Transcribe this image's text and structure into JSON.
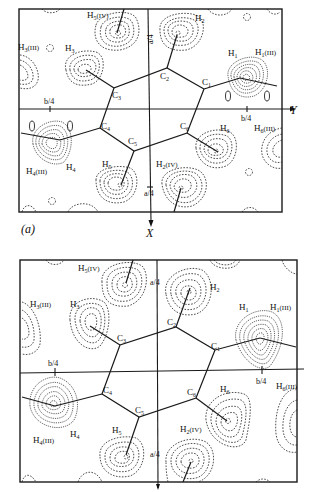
{
  "figure": {
    "panel_a": {
      "label": "(a)",
      "x_axis_label": "X",
      "y_axis_label": "Y",
      "tick_b4_left": "b/4",
      "tick_b4_right": "b/4",
      "tick_a4_top": "a/4",
      "tick_a4_bottom": "a/4",
      "carbons": [
        "C1",
        "C2",
        "C3",
        "C4",
        "C5",
        "C6"
      ],
      "hydrogens": [
        "H1",
        "H1(III)",
        "H2",
        "H2(IV)",
        "H3",
        "H3(III)",
        "H4",
        "H4(III)",
        "H5",
        "H5(IV)",
        "H6",
        "H6(III)"
      ]
    },
    "panel_b": {
      "tick_b4_left": "b/4",
      "tick_b4_right": "b/4",
      "tick_a4_top": "a/4",
      "tick_a4_bottom": "a/4",
      "carbons": [
        "C1",
        "C2",
        "C3",
        "C4",
        "C5",
        "C6"
      ],
      "hydrogens": [
        "H1",
        "H1(III)",
        "H2",
        "H2(IV)",
        "H3",
        "H3(III)",
        "H4",
        "H4(III)",
        "H5",
        "H5(IV)",
        "H6",
        "H6(III)"
      ]
    }
  },
  "labels": {
    "a": {
      "C1": "C",
      "C1s": "1",
      "C2": "C",
      "C2s": "2",
      "C3": "C",
      "C3s": "3",
      "C4": "C",
      "C4s": "4",
      "C5": "C",
      "C5s": "5",
      "C6": "C",
      "C6s": "6",
      "H1": "H",
      "H1s": "1",
      "H1iii": "H",
      "H1iiis": "1",
      "H1iiit": "(III)",
      "H2": "H",
      "H2s": "2",
      "H2iv": "H",
      "H2ivs": "2",
      "H2ivt": "(IV)",
      "H3": "H",
      "H3s": "3",
      "H3iii": "H",
      "H3iiis": "3",
      "H3iiit": "(III)",
      "H4": "H",
      "H4s": "4",
      "H4iii": "H",
      "H4iiis": "4",
      "H4iiit": "(III)",
      "H5": "H",
      "H5s": "5",
      "H5iv": "H",
      "H5ivs": "5",
      "H5ivt": "(IV)",
      "H6": "H",
      "H6s": "6",
      "H6iii": "H",
      "H6iiis": "6",
      "H6iiit": "(III)"
    }
  }
}
